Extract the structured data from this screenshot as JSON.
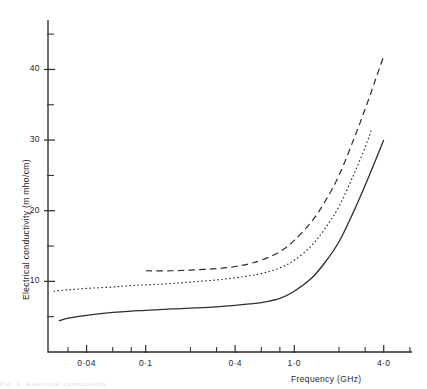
{
  "figure": {
    "background_color": "#ffffff",
    "ink_color": "#2b2b2b",
    "caption_fragment": "Fig. 1. Electrical conductivity"
  },
  "chart_data": {
    "type": "line",
    "title": "",
    "subtitle": "",
    "xlabel": "Frequency (GHz)",
    "ylabel": "Electrical conductivity (m mho/cm)",
    "xscale": "log",
    "yscale": "linear",
    "xlim": [
      0.022,
      6.2
    ],
    "ylim": [
      0.0,
      47.0
    ],
    "grid": false,
    "legend": "none",
    "x_major_ticks": [
      0.04,
      0.1,
      0.4,
      1.0,
      4.0
    ],
    "x_major_tick_labels": [
      "0·04",
      "0·1",
      "0·4",
      "1·0",
      "4·0"
    ],
    "x_minor_ticks": [
      0.03,
      0.06,
      0.08,
      0.2,
      0.3,
      0.6,
      0.8,
      2.0,
      3.0,
      6.0
    ],
    "y_major_ticks": [
      10,
      20,
      30,
      40
    ],
    "y_major_tick_labels": [
      "10",
      "20",
      "30",
      "40"
    ],
    "y_minor_ticks": [
      5,
      15,
      25,
      35,
      45
    ],
    "series": [
      {
        "name": "curve-solid",
        "linestyle": "solid",
        "x": [
          0.026,
          0.03,
          0.04,
          0.06,
          0.08,
          0.1,
          0.15,
          0.2,
          0.3,
          0.4,
          0.5,
          0.6,
          0.8,
          1.0,
          1.3,
          1.6,
          2.0,
          2.5,
          3.0,
          3.5,
          4.0
        ],
        "y": [
          4.4,
          4.8,
          5.2,
          5.6,
          5.8,
          5.9,
          6.1,
          6.2,
          6.4,
          6.6,
          6.8,
          7.0,
          7.6,
          8.6,
          10.4,
          12.6,
          15.6,
          19.8,
          23.6,
          27.0,
          30.0
        ]
      },
      {
        "name": "curve-dotted",
        "linestyle": "dotted",
        "x": [
          0.024,
          0.03,
          0.04,
          0.06,
          0.08,
          0.1,
          0.15,
          0.2,
          0.3,
          0.4,
          0.5,
          0.6,
          0.8,
          1.0,
          1.3,
          1.6,
          2.0,
          2.5,
          3.0,
          3.3
        ],
        "y": [
          8.6,
          8.8,
          9.0,
          9.2,
          9.4,
          9.5,
          9.7,
          9.9,
          10.2,
          10.5,
          10.8,
          11.1,
          11.9,
          13.0,
          15.0,
          17.4,
          20.6,
          25.0,
          29.0,
          31.4
        ]
      },
      {
        "name": "curve-dashed",
        "linestyle": "dashed",
        "x": [
          0.1,
          0.15,
          0.2,
          0.3,
          0.4,
          0.5,
          0.6,
          0.8,
          1.0,
          1.3,
          1.6,
          2.0,
          2.5,
          3.0,
          3.5,
          4.0
        ],
        "y": [
          11.5,
          11.5,
          11.6,
          11.8,
          12.1,
          12.5,
          13.0,
          14.2,
          15.8,
          18.4,
          21.2,
          25.0,
          30.0,
          34.4,
          38.4,
          41.9
        ]
      }
    ]
  }
}
